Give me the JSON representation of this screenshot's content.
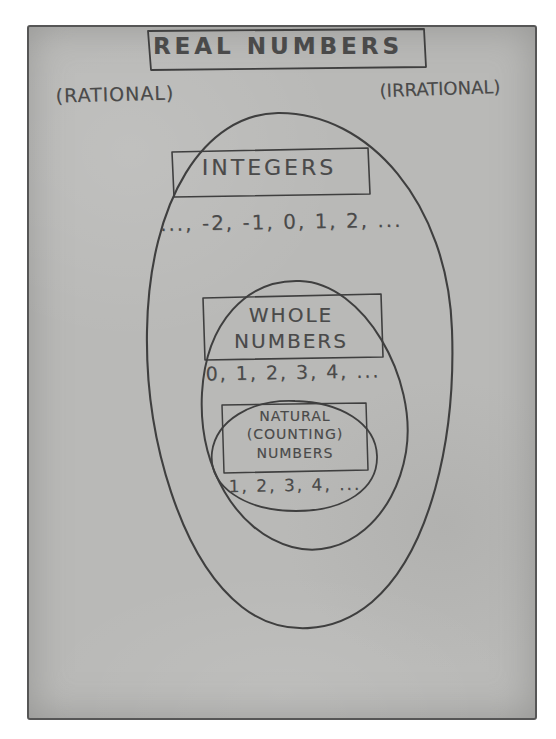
{
  "diagram": {
    "outer_set": {
      "name": "real-numbers",
      "label": "REAL NUMBERS",
      "subsets_labels": {
        "rational": "(RATIONAL)",
        "irrational": "(IRRATIONAL)"
      }
    },
    "sets": [
      {
        "name": "integers",
        "label": "INTEGERS",
        "values": "..., -2, -1, 0, 1, 2, ..."
      },
      {
        "name": "whole-numbers",
        "label": "WHOLE\nNUMBERS",
        "label_line1": "WHOLE",
        "label_line2": "NUMBERS",
        "values": "0, 1, 2, 3, 4, ..."
      },
      {
        "name": "natural-counting-numbers",
        "label_line1": "NATURAL",
        "label_line2": "(COUNTING)",
        "label_line3": "NUMBERS",
        "values": "1, 2, 3, 4, ..."
      }
    ],
    "colors": {
      "paper": "#b9b9b7",
      "pencil": "#4a4a4a",
      "ink_stroke": "#3f3f3f",
      "page_background": "#ffffff"
    }
  }
}
